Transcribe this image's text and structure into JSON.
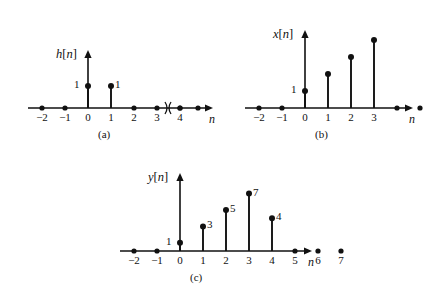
{
  "figure": {
    "background_color": "#ffffff",
    "ink_color": "#111111",
    "width": 441,
    "height": 288
  },
  "panels": [
    {
      "id": "a",
      "caption": "(a)",
      "signal_name": "h[n]",
      "axis_label": "n",
      "origin": {
        "x": 88,
        "y": 108
      },
      "step_x": 23,
      "unit_y": 22,
      "axis_start_x": -60,
      "axis_end_x": 125,
      "y_axis_top": -58,
      "has_break": true,
      "break_at_x": 80,
      "stems": [
        {
          "n": 0,
          "value": 1,
          "label": "1",
          "label_side": "left"
        },
        {
          "n": 1,
          "value": 1,
          "label": "1",
          "label_side": "right"
        }
      ],
      "zero_dots": [
        -2,
        -1,
        2,
        3,
        4
      ],
      "post_break_dots": [
        92,
        110
      ],
      "tick_labels": [
        {
          "n": -2,
          "text": "−2"
        },
        {
          "n": -1,
          "text": "−1"
        },
        {
          "n": 0,
          "text": "0"
        },
        {
          "n": 1,
          "text": "1"
        },
        {
          "n": 2,
          "text": "2"
        },
        {
          "n": 3,
          "text": "3"
        },
        {
          "n": 4,
          "text": "4"
        }
      ]
    },
    {
      "id": "b",
      "caption": "(b)",
      "signal_name": "x[n]",
      "axis_label": "n",
      "origin": {
        "x": 305,
        "y": 108
      },
      "step_x": 23,
      "unit_y": 17,
      "axis_start_x": -60,
      "axis_end_x": 108,
      "y_axis_top": -78,
      "has_break": false,
      "stems": [
        {
          "n": 0,
          "value": 1,
          "label": "1",
          "label_side": "left"
        },
        {
          "n": 1,
          "value": 2,
          "label": "",
          "label_side": "right"
        },
        {
          "n": 2,
          "value": 3,
          "label": "",
          "label_side": "right"
        },
        {
          "n": 3,
          "value": 4,
          "label": "",
          "label_side": "right"
        }
      ],
      "zero_dots": [
        -2,
        -1,
        4,
        5
      ],
      "post_break_dots": [],
      "tick_labels": [
        {
          "n": -2,
          "text": "−2"
        },
        {
          "n": -1,
          "text": "−1"
        },
        {
          "n": 0,
          "text": "0"
        },
        {
          "n": 1,
          "text": "1"
        },
        {
          "n": 2,
          "text": "2"
        },
        {
          "n": 3,
          "text": "3"
        }
      ]
    },
    {
      "id": "c",
      "caption": "(c)",
      "signal_name": "y[n]",
      "axis_label": "n",
      "origin": {
        "x": 180,
        "y": 251
      },
      "step_x": 23,
      "unit_y": 8.2,
      "axis_start_x": -60,
      "axis_end_x": 132,
      "y_axis_top": -78,
      "has_break": false,
      "stems": [
        {
          "n": 0,
          "value": 1,
          "label": "1",
          "label_side": "left"
        },
        {
          "n": 1,
          "value": 3,
          "label": "3",
          "label_side": "right"
        },
        {
          "n": 2,
          "value": 5,
          "label": "5",
          "label_side": "right"
        },
        {
          "n": 3,
          "value": 7,
          "label": "7",
          "label_side": "right"
        },
        {
          "n": 4,
          "value": 4,
          "label": "4",
          "label_side": "right"
        }
      ],
      "zero_dots": [
        -2,
        -1,
        5,
        6,
        7
      ],
      "post_break_dots": [],
      "tick_labels": [
        {
          "n": -2,
          "text": "−2"
        },
        {
          "n": -1,
          "text": "−1"
        },
        {
          "n": 0,
          "text": "0"
        },
        {
          "n": 1,
          "text": "1"
        },
        {
          "n": 2,
          "text": "2"
        },
        {
          "n": 3,
          "text": "3"
        },
        {
          "n": 4,
          "text": "4"
        },
        {
          "n": 5,
          "text": "5"
        },
        {
          "n": 6,
          "text": "6"
        },
        {
          "n": 7,
          "text": "7"
        }
      ]
    }
  ],
  "chart_data": {
    "type": "line",
    "title": "",
    "xlabel": "n",
    "ylabel": "",
    "subplots": [
      {
        "id": "a",
        "caption": "(a)",
        "ylabel": "h[n]",
        "type": "stem",
        "x": [
          -2,
          -1,
          0,
          1,
          2,
          3,
          4
        ],
        "values": [
          0,
          0,
          1,
          1,
          0,
          0,
          0
        ],
        "annotations": [
          "1",
          "1"
        ],
        "xlim": [
          -3,
          5
        ],
        "ylim": [
          0,
          1.4
        ],
        "axis_break_after": 4,
        "grid": false,
        "legend": "none"
      },
      {
        "id": "b",
        "caption": "(b)",
        "ylabel": "x[n]",
        "type": "stem",
        "x": [
          -2,
          -1,
          0,
          1,
          2,
          3,
          4,
          5
        ],
        "values": [
          0,
          0,
          1,
          2,
          3,
          4,
          0,
          0
        ],
        "annotations": [
          "1"
        ],
        "xlim": [
          -3,
          6
        ],
        "ylim": [
          0,
          4.6
        ],
        "grid": false,
        "legend": "none"
      },
      {
        "id": "c",
        "caption": "(c)",
        "ylabel": "y[n]",
        "type": "stem",
        "x": [
          -2,
          -1,
          0,
          1,
          2,
          3,
          4,
          5,
          6,
          7
        ],
        "values": [
          0,
          0,
          1,
          3,
          5,
          7,
          4,
          0,
          0,
          0
        ],
        "annotations": [
          "1",
          "3",
          "5",
          "7",
          "4"
        ],
        "xlim": [
          -3,
          8
        ],
        "ylim": [
          0,
          9
        ],
        "grid": false,
        "legend": "none"
      }
    ]
  }
}
